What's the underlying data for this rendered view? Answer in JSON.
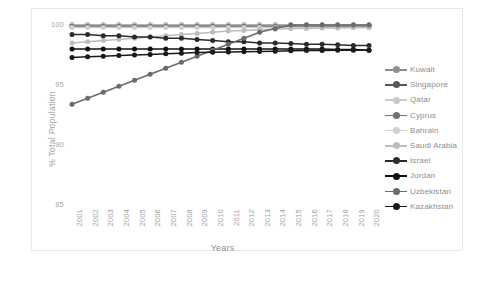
{
  "chart_data": {
    "type": "line",
    "title": "",
    "xlabel": "Years",
    "ylabel": "% Total Population",
    "grid": false,
    "legend_position": "right",
    "xlim": [
      2001,
      2020
    ],
    "ylim": [
      85,
      100.6
    ],
    "yticks": [
      85,
      90,
      95,
      100
    ],
    "x": [
      2001,
      2002,
      2003,
      2004,
      2005,
      2006,
      2007,
      2008,
      2009,
      2010,
      2011,
      2012,
      2013,
      2014,
      2015,
      2016,
      2017,
      2018,
      2019,
      2020
    ],
    "categories": [
      "2001",
      "2002",
      "2003",
      "2004",
      "2005",
      "2006",
      "2007",
      "2008",
      "2009",
      "2010",
      "2011",
      "2012",
      "2013",
      "2014",
      "2015",
      "2016",
      "2017",
      "2018",
      "2019",
      "2020"
    ],
    "series": [
      {
        "name": "Kuwait",
        "color": "#8f8f8f",
        "values": [
          100,
          100,
          100,
          100,
          100,
          100,
          100,
          100,
          100,
          100,
          100,
          100,
          100,
          100,
          100,
          100,
          100,
          100,
          100,
          100
        ]
      },
      {
        "name": "Singapore",
        "color": "#585858",
        "values": [
          100,
          100,
          100,
          100,
          100,
          100,
          100,
          100,
          100,
          100,
          100,
          100,
          100,
          100,
          100,
          100,
          100,
          100,
          100,
          100
        ]
      },
      {
        "name": "Qatar",
        "color": "#c9c9c9",
        "values": [
          100,
          100,
          100,
          100,
          100,
          100,
          100,
          100,
          100,
          100,
          100,
          100,
          100,
          100,
          100,
          100,
          100,
          100,
          100,
          100
        ]
      },
      {
        "name": "Cyprus",
        "color": "#707070",
        "values": [
          99.9,
          99.9,
          99.9,
          99.9,
          99.9,
          99.9,
          99.9,
          99.9,
          99.9,
          99.9,
          99.9,
          99.9,
          99.9,
          99.9,
          99.9,
          99.9,
          99.9,
          99.9,
          99.9,
          99.9
        ]
      },
      {
        "name": "Bahrain",
        "color": "#cfcfcf",
        "values": [
          99.8,
          99.8,
          99.8,
          99.8,
          99.8,
          99.8,
          99.8,
          99.8,
          99.8,
          99.8,
          99.8,
          99.8,
          99.8,
          99.8,
          99.8,
          99.8,
          99.8,
          99.8,
          99.8,
          99.8
        ]
      },
      {
        "name": "Saudi Arabia",
        "color": "#bdbdbd",
        "values": [
          98.5,
          98.6,
          98.7,
          98.8,
          98.9,
          99.0,
          99.1,
          99.2,
          99.3,
          99.4,
          99.5,
          99.55,
          99.6,
          99.65,
          99.7,
          99.7,
          99.75,
          99.75,
          99.8,
          99.8
        ]
      },
      {
        "name": "Israel",
        "color": "#2b2b2b",
        "values": [
          99.2,
          99.2,
          99.1,
          99.1,
          99.0,
          99.0,
          98.9,
          98.9,
          98.8,
          98.7,
          98.6,
          98.6,
          98.5,
          98.5,
          98.45,
          98.4,
          98.4,
          98.35,
          98.3,
          98.3
        ]
      },
      {
        "name": "Jordan",
        "color": "#111111",
        "values": [
          98.0,
          98.0,
          98.0,
          98.0,
          98.0,
          98.0,
          98.0,
          98.0,
          98.0,
          98.0,
          98.0,
          98.0,
          98.0,
          98.0,
          98.0,
          98.0,
          98.0,
          97.95,
          97.95,
          97.9
        ]
      },
      {
        "name": "Uzbekistan",
        "color": "#6b6b6b",
        "values": [
          93.4,
          93.9,
          94.4,
          94.9,
          95.4,
          95.9,
          96.4,
          96.9,
          97.4,
          97.9,
          98.4,
          98.9,
          99.4,
          99.7,
          100,
          100,
          100,
          100,
          100,
          100
        ]
      },
      {
        "name": "Kazakhstan",
        "color": "#1a1a1a",
        "values": [
          97.3,
          97.35,
          97.4,
          97.45,
          97.5,
          97.55,
          97.6,
          97.65,
          97.7,
          97.72,
          97.75,
          97.78,
          97.8,
          97.82,
          97.85,
          97.87,
          97.88,
          97.9,
          97.9,
          97.9
        ]
      }
    ]
  },
  "axis": {
    "y_label": "% Total Population",
    "x_label": "Years",
    "y_ticks": [
      "100",
      "95",
      "90",
      "85"
    ],
    "x_ticks": [
      "2001",
      "2002",
      "2003",
      "2004",
      "2005",
      "2006",
      "2007",
      "2008",
      "2009",
      "2010",
      "2011",
      "2012",
      "2013",
      "2014",
      "2015",
      "2016",
      "2017",
      "2018",
      "2019",
      "2020"
    ]
  },
  "legend": {
    "items": [
      {
        "label": "Kuwait",
        "color": "#8f8f8f"
      },
      {
        "label": "Singapore",
        "color": "#585858"
      },
      {
        "label": "Qatar",
        "color": "#c9c9c9"
      },
      {
        "label": "Cyprus",
        "color": "#707070"
      },
      {
        "label": "Bahrain",
        "color": "#cfcfcf"
      },
      {
        "label": "Saudi Arabia",
        "color": "#bdbdbd"
      },
      {
        "label": "Israel",
        "color": "#2b2b2b"
      },
      {
        "label": "Jordan",
        "color": "#111111"
      },
      {
        "label": "Uzbekistan",
        "color": "#6b6b6b"
      },
      {
        "label": "Kazakhstan",
        "color": "#1a1a1a"
      }
    ]
  },
  "style": {
    "background": "#ffffff",
    "border": "#e8e8ea",
    "tick_text": "#a0a0a6",
    "axis_label_text": "#909096"
  }
}
